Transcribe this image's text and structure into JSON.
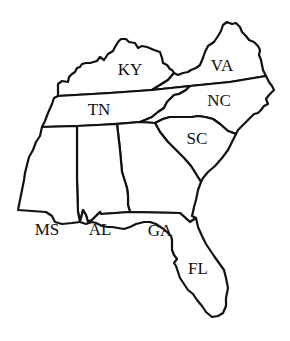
{
  "map": {
    "title": "",
    "region": "Southeastern United States",
    "colors": {
      "background": "#ffffff",
      "outline": "#111111",
      "fill": "#ffffff",
      "text": "#111111"
    },
    "states": [
      {
        "id": "KY",
        "label": "KY",
        "x": 130,
        "y": 69
      },
      {
        "id": "VA",
        "label": "VA",
        "x": 222,
        "y": 65
      },
      {
        "id": "TN",
        "label": "TN",
        "x": 99,
        "y": 109
      },
      {
        "id": "NC",
        "label": "NC",
        "x": 219,
        "y": 100
      },
      {
        "id": "SC",
        "label": "SC",
        "x": 197,
        "y": 138
      },
      {
        "id": "MS",
        "label": "MS",
        "x": 47,
        "y": 229
      },
      {
        "id": "AL",
        "label": "AL",
        "x": 100,
        "y": 229
      },
      {
        "id": "GA",
        "label": "GA",
        "x": 160,
        "y": 230
      },
      {
        "id": "FL",
        "label": "FL",
        "x": 198,
        "y": 268
      }
    ]
  }
}
